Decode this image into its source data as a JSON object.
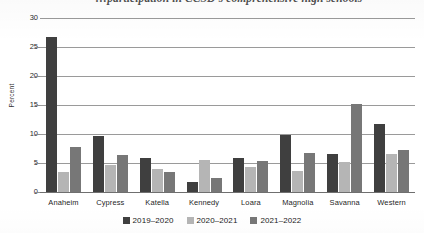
{
  "chart_data": {
    "type": "bar",
    "title": "…participation in CCSD's comprehensive high schools",
    "xlabel": "",
    "ylabel": "Percent",
    "ylim": [
      0,
      30
    ],
    "yticks": [
      0,
      5,
      10,
      15,
      20,
      25,
      30
    ],
    "grid": true,
    "legend_position": "bottom",
    "categories": [
      "Anaheim",
      "Cypress",
      "Katella",
      "Kennedy",
      "Loara",
      "Magnolia",
      "Savanna",
      "Western"
    ],
    "series": [
      {
        "name": "2019–2020",
        "color": "#3f3f3f",
        "values": [
          26.8,
          9.6,
          5.9,
          1.8,
          5.9,
          9.8,
          6.5,
          11.8
        ]
      },
      {
        "name": "2020–2021",
        "color": "#b5b5b5",
        "values": [
          3.5,
          4.7,
          4.0,
          5.5,
          4.3,
          3.6,
          5.2,
          6.5
        ]
      },
      {
        "name": "2021–2022",
        "color": "#777777",
        "values": [
          7.7,
          6.3,
          3.4,
          2.4,
          5.3,
          6.8,
          15.2,
          7.3
        ]
      }
    ]
  },
  "axis": {
    "y_title": "Percent"
  }
}
